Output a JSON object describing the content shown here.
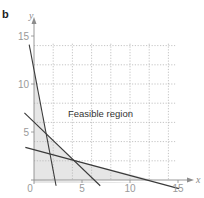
{
  "panel": {
    "label": "b"
  },
  "colors": {
    "line": "#3a3a3a",
    "grid": "#b5b5b5",
    "axis": "#8c8c8c",
    "shade": "#e6e6e6",
    "tick_text": "#9a9a9a"
  },
  "chart_data": {
    "type": "line",
    "title": "",
    "xlabel": "x",
    "ylabel": "y",
    "xlim": [
      -1,
      15.5
    ],
    "ylim": [
      -1,
      15.5
    ],
    "x_ticks": [
      0,
      5,
      10,
      15
    ],
    "y_ticks": [
      5,
      10,
      15
    ],
    "x_tick_labels": [
      "0",
      "5",
      "10",
      "15"
    ],
    "y_tick_labels": [
      "5",
      "10",
      "15"
    ],
    "grid": {
      "on": true,
      "style": "dotted",
      "spacing": 2,
      "x_from": 2,
      "x_to": 14,
      "y_from": 2,
      "y_to": 14
    },
    "series": [
      {
        "name": "steep constraint line",
        "points": [
          [
            -0.5,
            14.1
          ],
          [
            2.3,
            -0.6
          ]
        ]
      },
      {
        "name": "medium constraint line",
        "points": [
          [
            -1.0,
            7.0
          ],
          [
            6.9,
            -0.6
          ]
        ]
      },
      {
        "name": "shallow constraint line",
        "points": [
          [
            -0.9,
            3.4
          ],
          [
            15.1,
            -0.9
          ]
        ]
      }
    ],
    "intersections": [
      {
        "lines": [
          "steep",
          "medium"
        ],
        "point": [
          1.2,
          5.0
        ]
      },
      {
        "lines": [
          "steep",
          "shallow"
        ],
        "point": [
          1.6,
          2.8
        ]
      },
      {
        "lines": [
          "medium",
          "shallow"
        ],
        "point": [
          4.0,
          2.1
        ]
      }
    ],
    "shaded_region": {
      "meaning": "infeasible (shaded grey, below the constraint lines)",
      "vertices": [
        [
          0,
          11.4
        ],
        [
          1.2,
          5.0
        ],
        [
          4.0,
          2.1
        ],
        [
          12.4,
          0
        ],
        [
          0,
          0
        ]
      ]
    },
    "annotations": [
      {
        "text": "Feasible region",
        "x": 3.5,
        "y": 6.8
      }
    ]
  },
  "labels": {
    "region": "Feasible region",
    "x_axis": "x",
    "y_axis": "y",
    "origin": "0"
  }
}
